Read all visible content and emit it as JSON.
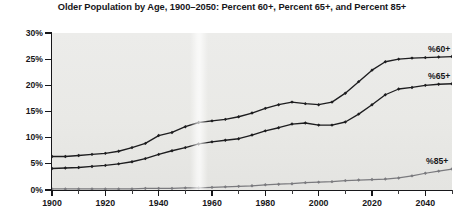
{
  "chart_data": {
    "type": "line",
    "title": "Older Population by Age, 1900–2050: Percent 60+, Percent 65+, and Percent 85+",
    "xlabel": "",
    "ylabel": "",
    "xlim": [
      1900,
      2050
    ],
    "ylim": [
      0,
      30
    ],
    "grid": false,
    "legend_position": "inline-right-end-labels",
    "y_tick_labels": [
      "30%",
      "25%",
      "20%",
      "15%",
      "10%",
      "5%",
      "0%"
    ],
    "y_tick_values": [
      30,
      25,
      20,
      15,
      10,
      5,
      0
    ],
    "x_tick_labels": [
      "1900",
      "1920",
      "1940",
      "1960",
      "1980",
      "2000",
      "2020",
      "2040"
    ],
    "x_tick_values": [
      1900,
      1920,
      1940,
      1960,
      1980,
      2000,
      2020,
      2040
    ],
    "x_minor_tick_values": [
      1910,
      1930,
      1950,
      1970,
      1990,
      2010,
      2030,
      2050
    ],
    "x": [
      1900,
      1905,
      1910,
      1915,
      1920,
      1925,
      1930,
      1935,
      1940,
      1945,
      1950,
      1955,
      1960,
      1965,
      1970,
      1975,
      1980,
      1985,
      1990,
      1995,
      2000,
      2005,
      2010,
      2015,
      2020,
      2025,
      2030,
      2035,
      2040,
      2045,
      2050
    ],
    "series": [
      {
        "name": "%60+",
        "label": "%60+",
        "color": "#1d1d1f",
        "marker": "diamond",
        "values": [
          6.4,
          6.4,
          6.6,
          6.8,
          7.0,
          7.4,
          8.1,
          8.9,
          10.4,
          11.0,
          12.1,
          12.9,
          13.2,
          13.5,
          14.0,
          14.7,
          15.6,
          16.3,
          16.8,
          16.5,
          16.3,
          16.8,
          18.5,
          20.7,
          22.9,
          24.5,
          25.0,
          25.2,
          25.3,
          25.4,
          25.5
        ]
      },
      {
        "name": "%65+",
        "label": "%65+",
        "color": "#1d1d1f",
        "marker": "diamond",
        "values": [
          4.1,
          4.2,
          4.3,
          4.5,
          4.7,
          5.0,
          5.4,
          6.0,
          6.8,
          7.5,
          8.1,
          8.8,
          9.2,
          9.5,
          9.8,
          10.5,
          11.3,
          11.9,
          12.6,
          12.8,
          12.4,
          12.4,
          13.0,
          14.5,
          16.3,
          18.2,
          19.3,
          19.6,
          20.0,
          20.2,
          20.3
        ]
      },
      {
        "name": "%85+",
        "label": "%85+",
        "color": "#7a7a7e",
        "marker": "diamond",
        "values": [
          0.2,
          0.2,
          0.2,
          0.2,
          0.2,
          0.2,
          0.2,
          0.3,
          0.3,
          0.3,
          0.4,
          0.4,
          0.5,
          0.6,
          0.7,
          0.8,
          1.0,
          1.1,
          1.2,
          1.4,
          1.5,
          1.6,
          1.8,
          1.9,
          2.0,
          2.1,
          2.3,
          2.7,
          3.2,
          3.6,
          4.0
        ]
      }
    ]
  }
}
